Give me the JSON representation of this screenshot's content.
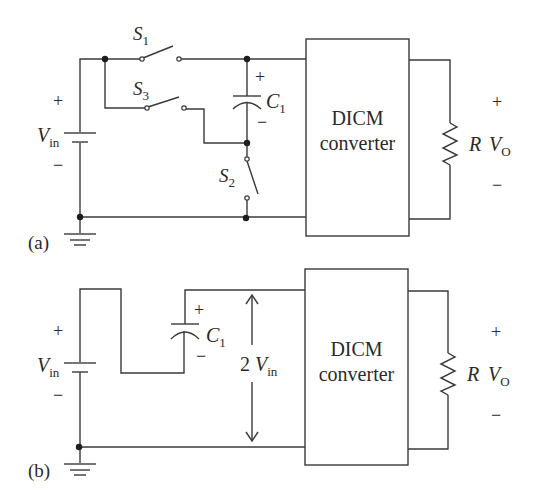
{
  "figure": {
    "panel_a": {
      "label": "(a)",
      "source": {
        "name": "V",
        "sub": "in",
        "plus": "+",
        "minus": "−"
      },
      "switches": [
        {
          "name": "S",
          "sub": "1"
        },
        {
          "name": "S",
          "sub": "3"
        },
        {
          "name": "S",
          "sub": "2"
        }
      ],
      "capacitor": {
        "name": "C",
        "sub": "1",
        "plus": "+",
        "minus": "−"
      },
      "converter": {
        "line1": "DICM",
        "line2": "converter"
      },
      "load": {
        "name": "R"
      },
      "output": {
        "name": "V",
        "sub": "O",
        "plus": "+",
        "minus": "−"
      }
    },
    "panel_b": {
      "label": "(b)",
      "source": {
        "name": "V",
        "sub": "in",
        "plus": "+",
        "minus": "−"
      },
      "capacitor": {
        "name": "C",
        "sub": "1",
        "plus": "+",
        "minus": "−"
      },
      "voltage_arrow": {
        "prefix": "2 ",
        "name": "V",
        "sub": "in"
      },
      "converter": {
        "line1": "DICM",
        "line2": "converter"
      },
      "load": {
        "name": "R"
      },
      "output": {
        "name": "V",
        "sub": "O",
        "plus": "+",
        "minus": "−"
      }
    }
  }
}
